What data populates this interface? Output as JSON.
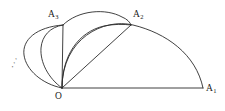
{
  "figure": {
    "type": "geometric-diagram",
    "background_color": "#ffffff",
    "stroke_color": "#2b2b2b",
    "labels": {
      "origin": {
        "text": "O",
        "base": "O",
        "subscript": ""
      },
      "point_1": {
        "text": "A1",
        "base": "A",
        "subscript": "1"
      },
      "point_2": {
        "text": "A2",
        "base": "A",
        "subscript": "2"
      },
      "point_3": {
        "text": "A3",
        "base": "A",
        "subscript": "3"
      },
      "continuation": {
        "text": "⋰"
      }
    },
    "points": {
      "O": {
        "x": 62,
        "y": 88
      },
      "A1": {
        "x": 203,
        "y": 88
      },
      "A2": {
        "x": 131,
        "y": 25
      },
      "A3": {
        "x": 63,
        "y": 25
      }
    },
    "segments": [
      {
        "name": "base-line-O-A1",
        "from": "O",
        "to": "A1"
      },
      {
        "name": "chord-O-A2",
        "from": "O",
        "to": "A2"
      },
      {
        "name": "chord-O-A3",
        "from": "O",
        "to": "A3"
      }
    ],
    "arcs": [
      {
        "name": "semicircle-O-A1",
        "from": "O",
        "to": "A1",
        "bulge": "up"
      },
      {
        "name": "arc-O-A2",
        "from": "O",
        "to": "A2",
        "bulge": "up-left"
      },
      {
        "name": "arc-A3-A2",
        "from": "A3",
        "to": "A2",
        "bulge": "up"
      },
      {
        "name": "arc-O-A3-outer",
        "from": "O",
        "to": "A3",
        "bulge": "left"
      },
      {
        "name": "arc-O-A3-inner",
        "from": "O",
        "to": "A3",
        "bulge": "left"
      }
    ]
  }
}
